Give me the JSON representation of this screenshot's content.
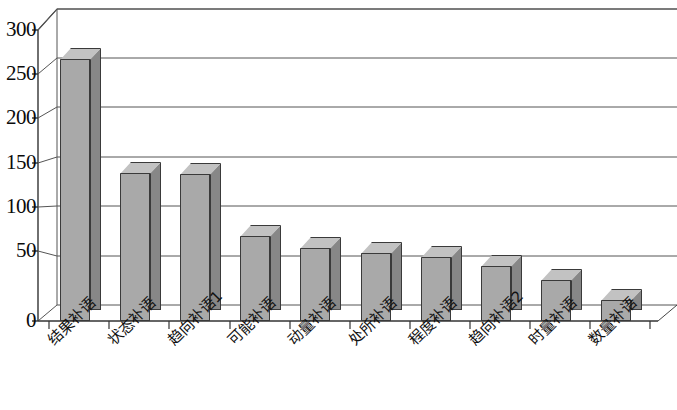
{
  "chart_data": {
    "type": "bar",
    "title": "",
    "subtitle": "",
    "xlabel": "",
    "ylabel": "",
    "categories": [
      "结果补语",
      "状态补语",
      "趋向补语1",
      "可能补语",
      "动量补语",
      "处所补语",
      "程度补语",
      "趋向补语2",
      "时量补语",
      "数量补语"
    ],
    "values": [
      270,
      153,
      152,
      88,
      75,
      70,
      66,
      57,
      42,
      22
    ],
    "series": [
      {
        "name": "",
        "values": [
          270,
          153,
          152,
          88,
          75,
          70,
          66,
          57,
          42,
          22
        ]
      }
    ],
    "ylim": [
      0,
      300
    ],
    "yticks": [
      0,
      50,
      100,
      150,
      200,
      250,
      300
    ],
    "ytick_labels": [
      "0",
      "50",
      "100",
      "150",
      "200",
      "250",
      "300"
    ],
    "grid": true,
    "grid_axis": "y",
    "legend": false,
    "legend_position": "none",
    "style": "3d-column",
    "colors": {
      "bar_front": "#a9a9a9",
      "bar_side": "#878787",
      "bar_top": "#c2c2c2",
      "outline": "#3a3a3a",
      "background": "#ffffff",
      "gridline": "#555555",
      "axis": "#333333"
    }
  }
}
